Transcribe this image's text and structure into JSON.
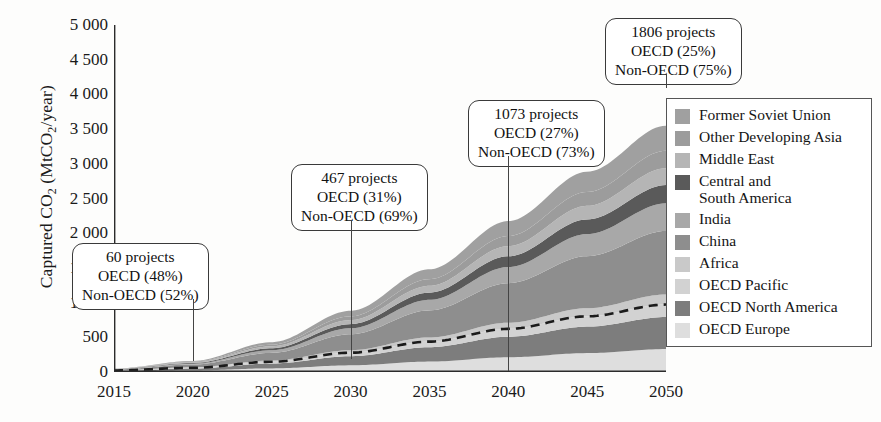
{
  "chart_data": {
    "type": "area",
    "title": "",
    "subtitle": "",
    "xlabel": "",
    "ylabel": "Captured CO2 (MtCO2/year)",
    "ylabel_rich": "Captured CO<sub>2</sub> (MtCO<sub>2</sub>/year)",
    "x": [
      2015,
      2020,
      2025,
      2030,
      2035,
      2040,
      2045,
      2050
    ],
    "xlim": [
      2015,
      2050
    ],
    "ylim": [
      0,
      5000
    ],
    "xticks": [
      "2015",
      "2020",
      "2025",
      "2030",
      "2035",
      "2040",
      "2045",
      "2050"
    ],
    "yticks": [
      "0",
      "500",
      "1 000",
      "1 500",
      "2 000",
      "2 500",
      "3 000",
      "3 500",
      "4 000",
      "4 500",
      "5 000"
    ],
    "grid": false,
    "stacked": true,
    "legend_position": "right-inside",
    "series": [
      {
        "name": "OECD Europe",
        "color": "#dedede",
        "values": [
          8,
          22,
          52,
          96,
          150,
          212,
          272,
          330
        ]
      },
      {
        "name": "OECD North America",
        "color": "#7d7d7d",
        "values": [
          10,
          28,
          70,
          132,
          208,
          296,
          382,
          462
        ]
      },
      {
        "name": "OECD Pacific",
        "color": "#d2d2d2",
        "values": [
          4,
          11,
          26,
          50,
          80,
          114,
          148,
          180
        ]
      },
      {
        "name": "Africa",
        "color": "#c9c9c9",
        "values": [
          2,
          7,
          18,
          36,
          60,
          88,
          117,
          145
        ]
      },
      {
        "name": "China",
        "color": "#8e8e8e",
        "values": [
          12,
          40,
          110,
          230,
          390,
          570,
          750,
          915
        ]
      },
      {
        "name": "India",
        "color": "#a8a8a8",
        "values": [
          3,
          12,
          38,
          86,
          152,
          232,
          318,
          400
        ]
      },
      {
        "name": "Central and\nSouth America",
        "color": "#5a5a5a",
        "values": [
          3,
          10,
          28,
          60,
          104,
          156,
          212,
          262
        ]
      },
      {
        "name": "Middle East",
        "color": "#b5b5b5",
        "values": [
          3,
          10,
          28,
          58,
          98,
          145,
          195,
          242
        ]
      },
      {
        "name": "Other Developing Asia",
        "color": "#9c9c9c",
        "values": [
          2,
          8,
          24,
          54,
          96,
          146,
          200,
          252
        ]
      },
      {
        "name": "Former Soviet Union",
        "color": "#a0a0a0",
        "values": [
          3,
          12,
          36,
          80,
          142,
          216,
          292,
          362
        ]
      }
    ],
    "overlay_line": {
      "name": "OECD total",
      "style": "dashed",
      "color": "#1b1b1b",
      "values": [
        22,
        61,
        148,
        278,
        438,
        622,
        802,
        972
      ]
    },
    "annotations": [
      {
        "id": "callout-2020",
        "x": 2020,
        "lines": [
          "60 projects",
          "OECD (48%)",
          "Non-OECD (52%)"
        ],
        "projects": "60 projects",
        "oecd": "OECD (48%)",
        "non_oecd": "Non-OECD (52%)"
      },
      {
        "id": "callout-2030",
        "x": 2030,
        "lines": [
          "467 projects",
          "OECD (31%)",
          "Non-OECD (69%)"
        ],
        "projects": "467 projects",
        "oecd": "OECD (31%)",
        "non_oecd": "Non-OECD (69%)"
      },
      {
        "id": "callout-2040",
        "x": 2040,
        "lines": [
          "1073 projects",
          "OECD (27%)",
          "Non-OECD (73%)"
        ],
        "projects": "1073 projects",
        "oecd": "OECD (27%)",
        "non_oecd": "Non-OECD (73%)"
      },
      {
        "id": "callout-2050",
        "x": 2050,
        "lines": [
          "1806 projects",
          "OECD (25%)",
          "Non-OECD (75%)"
        ],
        "projects": "1806 projects",
        "oecd": "OECD (25%)",
        "non_oecd": "Non-OECD (75%)"
      }
    ],
    "legend_entries": [
      {
        "label": "Former Soviet Union",
        "color": "#a0a0a0"
      },
      {
        "label": "Other Developing Asia",
        "color": "#9c9c9c"
      },
      {
        "label": "Middle East",
        "color": "#b5b5b5"
      },
      {
        "label": "Central and\nSouth America",
        "color": "#5a5a5a"
      },
      {
        "label": "India",
        "color": "#a8a8a8"
      },
      {
        "label": "China",
        "color": "#8e8e8e"
      },
      {
        "label": "Africa",
        "color": "#c9c9c9"
      },
      {
        "label": "OECD Pacific",
        "color": "#d2d2d2"
      },
      {
        "label": "OECD North America",
        "color": "#7d7d7d"
      },
      {
        "label": "OECD Europe",
        "color": "#dedede"
      }
    ]
  }
}
